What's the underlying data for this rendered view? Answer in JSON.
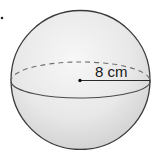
{
  "figure": {
    "type": "sphere",
    "radius_label": "8 cm",
    "colors": {
      "outline": "#3a3a3a",
      "fill_light": "#f2f2f2",
      "fill_dark": "#d4d4d4",
      "dashed": "#6e6e6e",
      "text": "#1a1a1a"
    }
  },
  "marker": {
    "bullet": "•"
  }
}
